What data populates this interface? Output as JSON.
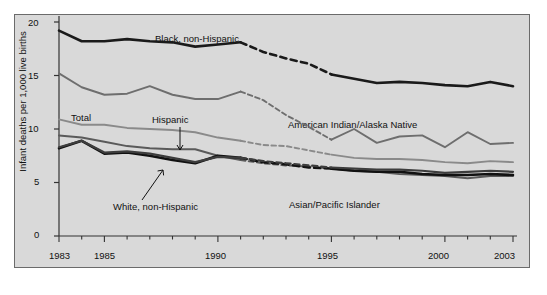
{
  "chart_data": {
    "type": "line",
    "title": "",
    "xlabel": "",
    "ylabel": "Infant deaths per 1,000 live births",
    "ylim": [
      0,
      20
    ],
    "xlim": [
      1983,
      2003
    ],
    "yticks": [
      "0",
      "5",
      "10",
      "15",
      "20"
    ],
    "ytick_values": [
      0,
      5,
      10,
      15,
      20
    ],
    "xticks_labeled": [
      "1983",
      "1985",
      "1990",
      "1995",
      "2000",
      "2003"
    ],
    "xtick_values_labeled": [
      1983,
      1985,
      1990,
      1995,
      2000,
      2003
    ],
    "x": [
      1983,
      1984,
      1985,
      1986,
      1987,
      1988,
      1989,
      1990,
      1991,
      1992,
      1993,
      1994,
      1995,
      1996,
      1997,
      1998,
      1999,
      2000,
      2001,
      2002,
      2003
    ],
    "grid": false,
    "legend_position": "inline-annotations",
    "dashed_range": [
      1991,
      1995
    ],
    "dashed_note": "Lines are dashed between 1991 and 1995 indicating a break in comparable data",
    "series": [
      {
        "name": "Black, non-Hispanic",
        "color": "#1a1a1a",
        "width": 2.6,
        "values": [
          19.2,
          18.2,
          18.2,
          18.4,
          18.2,
          18.1,
          17.7,
          17.9,
          18.1,
          17.2,
          16.6,
          16.1,
          15.1,
          14.7,
          14.3,
          14.4,
          14.3,
          14.1,
          14.0,
          14.4,
          14.0
        ]
      },
      {
        "name": "American Indian/Alaska Native",
        "color": "#6e6e6e",
        "width": 1.9,
        "values": [
          15.2,
          13.9,
          13.2,
          13.3,
          14.0,
          13.2,
          12.8,
          12.8,
          13.5,
          12.7,
          11.3,
          10.2,
          9.0,
          10.0,
          8.7,
          9.3,
          9.4,
          8.3,
          9.7,
          8.6,
          8.7
        ]
      },
      {
        "name": "Total",
        "color": "#8a8a8a",
        "width": 1.9,
        "values": [
          10.9,
          10.4,
          10.4,
          10.1,
          10.0,
          9.9,
          9.7,
          9.2,
          8.9,
          8.5,
          8.4,
          8.0,
          7.6,
          7.3,
          7.2,
          7.2,
          7.1,
          6.9,
          6.8,
          7.0,
          6.9
        ]
      },
      {
        "name": "Hispanic",
        "color": "#5a5a5a",
        "width": 2.0,
        "values": [
          9.4,
          9.2,
          8.8,
          8.4,
          8.2,
          8.1,
          8.1,
          7.5,
          7.1,
          6.8,
          6.6,
          6.5,
          6.3,
          6.1,
          6.0,
          5.8,
          5.7,
          5.6,
          5.4,
          5.6,
          5.6
        ]
      },
      {
        "name": "White, non-Hispanic",
        "color": "#111111",
        "width": 2.6,
        "values": [
          8.2,
          8.9,
          7.7,
          7.8,
          7.5,
          7.1,
          6.8,
          7.5,
          7.3,
          6.9,
          6.7,
          6.4,
          6.3,
          6.1,
          6.0,
          6.0,
          5.8,
          5.7,
          5.7,
          5.8,
          5.7
        ]
      },
      {
        "name": "Asian/Pacific Islander",
        "color": "#3d3d3d",
        "width": 2.2,
        "values": [
          8.3,
          8.9,
          7.8,
          7.9,
          7.7,
          7.3,
          6.9,
          7.4,
          7.3,
          7.0,
          6.8,
          6.6,
          6.4,
          6.3,
          6.2,
          6.2,
          6.1,
          5.9,
          6.0,
          6.1,
          6.0
        ]
      }
    ],
    "annotations": [
      {
        "text": "Black, non-Hispanic",
        "x": 155,
        "y": 37
      },
      {
        "text": "American Indian/Alaska Native",
        "x": 288,
        "y": 123
      },
      {
        "text": "Total",
        "x": 71,
        "y": 116
      },
      {
        "text": "Hispanic",
        "x": 152,
        "y": 118
      },
      {
        "text": "White, non-Hispanic",
        "x": 113,
        "y": 205
      },
      {
        "text": "Asian/Pacific Islander",
        "x": 289,
        "y": 203
      }
    ]
  }
}
